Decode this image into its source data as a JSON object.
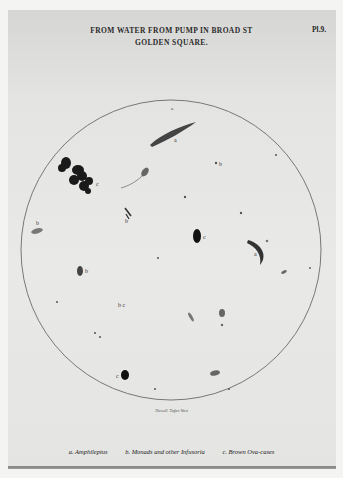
{
  "plate": {
    "title_line1": "FROM WATER FROM PUMP IN BROAD ST",
    "title_line2": "GOLDEN SQUARE.",
    "plate_number": "Pl.9.",
    "engraver": "Hassall. Tuffen West",
    "legend": {
      "a": "a. Amphileptus",
      "b": "b. Monads and other Infusoria",
      "c": "c. Brown Ova-cases"
    },
    "specimen_labels": {
      "a": "a",
      "b": "b",
      "c": "c",
      "bc": "b c"
    },
    "colors": {
      "page": "#e8e8e6",
      "ink": "#1e1e1e",
      "circle": "#555555"
    }
  }
}
